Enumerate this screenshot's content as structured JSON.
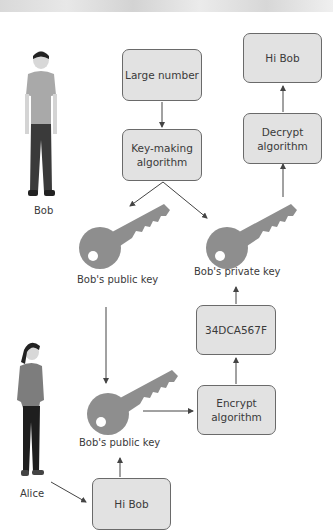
{
  "diagram": {
    "people": {
      "bob": {
        "label": "Bob"
      },
      "alice": {
        "label": "Alice"
      }
    },
    "boxes": {
      "large_number": "Large number",
      "key_making": "Key-making algorithm",
      "hi_bob_top": "Hi Bob",
      "decrypt": "Decrypt algorithm",
      "ciphertext": "34DCA567F",
      "encrypt": "Encrypt algorithm",
      "hi_bob_bottom": "Hi Bob"
    },
    "keys": {
      "public_key_top": "Bob's public key",
      "private_key": "Bob's private key",
      "public_key_bottom": "Bob's public key"
    },
    "colors": {
      "box_fill": "#e2e2e2",
      "box_border": "#6a6a6a",
      "key_fill": "#8e8e8e",
      "arrow": "#444444"
    }
  }
}
